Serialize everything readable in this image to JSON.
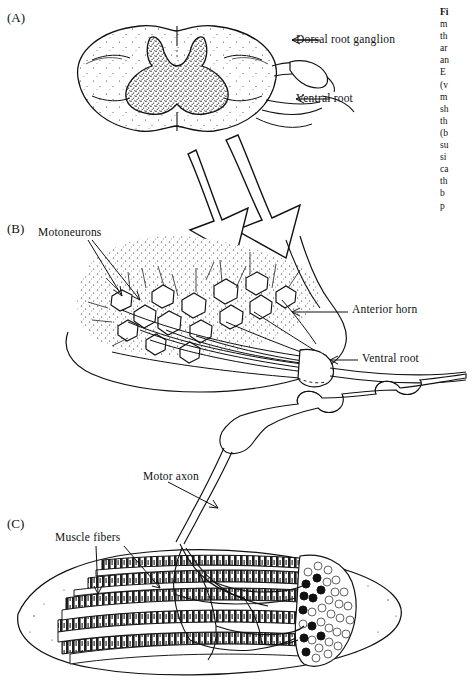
{
  "figure": {
    "background_color": "#ffffff",
    "ink_color": "#111111",
    "panels": [
      {
        "id": "A",
        "label": "(A)",
        "subject": "spinal-cord-cross-section"
      },
      {
        "id": "B",
        "label": "(B)",
        "subject": "anterior-horn-motoneurons"
      },
      {
        "id": "C",
        "label": "(C)",
        "subject": "skeletal-muscle-motor-unit"
      }
    ],
    "annotations": [
      {
        "name": "dorsal-root-ganglion",
        "text": "Dorsal root ganglion",
        "panel": "A"
      },
      {
        "name": "ventral-root-a",
        "text": "Ventral root",
        "panel": "A"
      },
      {
        "name": "motoneurons",
        "text": "Motoneurons",
        "panel": "B"
      },
      {
        "name": "anterior-horn",
        "text": "Anterior horn",
        "panel": "B"
      },
      {
        "name": "ventral-root-b",
        "text": "Ventral root",
        "panel": "B"
      },
      {
        "name": "motor-axon",
        "text": "Motor axon",
        "panel": "B-C"
      },
      {
        "name": "muscle-fibers",
        "text": "Muscle fibers",
        "panel": "C"
      }
    ]
  },
  "caption": {
    "note": "Caption column is clipped by the right edge of the screenshot; only the first one to two characters of each line are legible.",
    "lines": [
      "Fi",
      "m",
      "th",
      "ar",
      "an",
      "E",
      "(v",
      "m",
      "sh",
      "th",
      "(b",
      "su",
      "si",
      "ca",
      "th",
      "b",
      "p",
      "w",
      "n",
      "n",
      "a"
    ]
  }
}
